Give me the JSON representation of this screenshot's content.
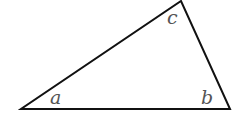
{
  "diagram": {
    "type": "triangle",
    "stroke_color": "#111111",
    "label_color": "#555555",
    "vertices": {
      "left": [
        21,
        109
      ],
      "right": [
        230,
        109
      ],
      "top": [
        181,
        1
      ]
    },
    "angles": [
      {
        "label": "a",
        "x": 50,
        "y": 104
      },
      {
        "label": "b",
        "x": 201,
        "y": 104
      },
      {
        "label": "c",
        "x": 167,
        "y": 24
      }
    ]
  }
}
